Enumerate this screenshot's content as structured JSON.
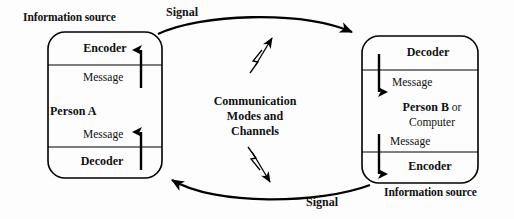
{
  "diagram": {
    "background_color": "#fdfdfd",
    "line_color": "#000000",
    "text_color": "#111111"
  },
  "left_unit": {
    "caption": "Information source",
    "top_slot": "Encoder",
    "upper_message": "Message",
    "middle_label": "Person A",
    "lower_message": "Message",
    "bottom_slot": "Decoder",
    "flow_direction": "upward"
  },
  "right_unit": {
    "caption": "Information source",
    "top_slot": "Decoder",
    "upper_message": "Message",
    "middle_label_bold": "Person B",
    "middle_label_rest": " or",
    "middle_label_second_line": "Computer",
    "lower_message": "Message",
    "bottom_slot": "Encoder",
    "flow_direction": "downward"
  },
  "center": {
    "line1": "Communication",
    "line2": "Modes and",
    "line3": "Channels"
  },
  "signals": {
    "top_label": "Signal",
    "bottom_label": "Signal",
    "top_icon": "lightning-bolt-icon",
    "bottom_icon": "lightning-bolt-icon"
  }
}
